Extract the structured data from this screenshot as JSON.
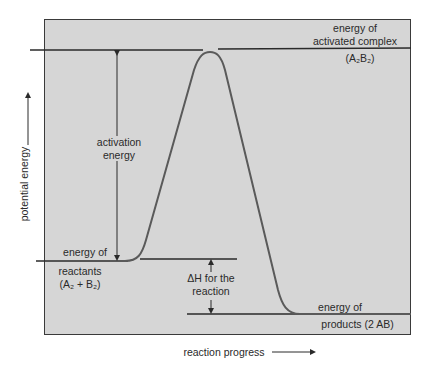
{
  "diagram": {
    "type": "potential-energy-diagram",
    "y_axis_label": "potential energy",
    "x_axis_label": "reaction progress",
    "labels": {
      "activated_complex_line1": "energy of",
      "activated_complex_line2": "activated complex",
      "activated_complex_formula": "(A₂B₂)",
      "activation_energy_line1": "activation",
      "activation_energy_line2": "energy",
      "reactants_line1": "energy of",
      "reactants_line2": "reactants",
      "reactants_formula": "(A₂ + B₂)",
      "delta_h_line1": "ΔH for the",
      "delta_h_line2": "reaction",
      "products_line1": "energy of",
      "products_line2": "products (2 AB)"
    },
    "levels": {
      "activated_complex_y": 50,
      "reactants_y": 259,
      "products_y": 314
    },
    "colors": {
      "background": "#d6d6d6",
      "frame": "#3a3a3a",
      "curve": "#5a5a5a",
      "lines": "#2a2a2a"
    }
  }
}
